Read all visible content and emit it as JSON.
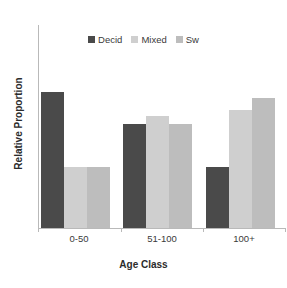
{
  "chart_data": {
    "type": "bar",
    "title": "",
    "xlabel": "Age Class",
    "ylabel": "Relative Proportion",
    "categories": [
      "0-50",
      "51-100",
      "100+"
    ],
    "series": [
      {
        "name": "Decid",
        "color": "#4a4a4a",
        "values": [
          0.67,
          0.51,
          0.3
        ]
      },
      {
        "name": "Mixed",
        "color": "#cfcfcf",
        "values": [
          0.3,
          0.55,
          0.58
        ]
      },
      {
        "name": "Sw",
        "color": "#bdbdbd",
        "values": [
          0.3,
          0.51,
          0.64
        ]
      }
    ],
    "ylim": [
      0,
      1.0
    ],
    "yticks": [],
    "grid": false,
    "legend_position": "top-center",
    "axis_color": "#b9b9b9"
  }
}
